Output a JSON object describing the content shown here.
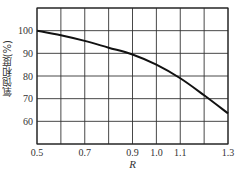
{
  "chart_data": {
    "type": "line",
    "title": "",
    "xlabel": "R",
    "ylabel": "氧饱和度(%)",
    "xlim": [
      0.5,
      1.3
    ],
    "ylim": [
      50,
      110
    ],
    "grid": true,
    "legend": null,
    "x_gridlines": [
      0.5,
      0.6,
      0.7,
      0.8,
      0.9,
      1.0,
      1.1,
      1.2,
      1.3
    ],
    "y_gridlines": [
      50,
      60,
      70,
      80,
      90,
      100,
      110
    ],
    "x_tick_labels": [
      "0.5",
      "0.7",
      "0.9",
      "1.0",
      "1.1",
      "1.3"
    ],
    "x_tick_values": [
      0.5,
      0.7,
      0.9,
      1.0,
      1.1,
      1.3
    ],
    "y_tick_labels": [
      "60",
      "70",
      "80",
      "90",
      "100"
    ],
    "y_tick_values": [
      60,
      70,
      80,
      90,
      100
    ],
    "series": [
      {
        "name": "oxygen-saturation-vs-R",
        "x": [
          0.5,
          0.6,
          0.7,
          0.8,
          0.9,
          1.0,
          1.1,
          1.2,
          1.3
        ],
        "values": [
          100,
          98,
          95.5,
          92.5,
          89.5,
          85,
          79,
          71.5,
          63.5
        ]
      }
    ]
  }
}
